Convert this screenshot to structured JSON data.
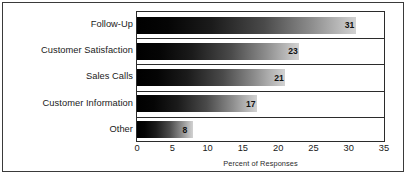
{
  "chart_data": {
    "type": "bar",
    "orientation": "horizontal",
    "title": "",
    "subtitle": "",
    "xlabel": "Percent of Responses",
    "ylabel": "",
    "categories": [
      "Follow-Up",
      "Customer Satisfaction",
      "Sales Calls",
      "Customer Information",
      "Other"
    ],
    "values": [
      31,
      23,
      21,
      17,
      8
    ],
    "data_labels": [
      "31",
      "23",
      "21",
      "17",
      "8"
    ],
    "xlim": [
      0,
      35
    ],
    "xticks": [
      0,
      5,
      10,
      15,
      20,
      25,
      30,
      35
    ],
    "xtick_labels": [
      "0",
      "5",
      "10",
      "15",
      "20",
      "25",
      "30",
      "35"
    ],
    "grid": false,
    "row_separators": true,
    "legend": null,
    "legend_position": "none",
    "bar_style": {
      "fill": "horizontal-gradient",
      "gradient_from": "#000000",
      "gradient_to": "#d2d2d2"
    },
    "colors": {
      "frame": "#3a3a3a",
      "plot_border": "#2b2b2b",
      "text": "#1a1a1a",
      "label_text": "#111111",
      "background": "#ffffff"
    }
  },
  "footer": {
    "note": ""
  }
}
